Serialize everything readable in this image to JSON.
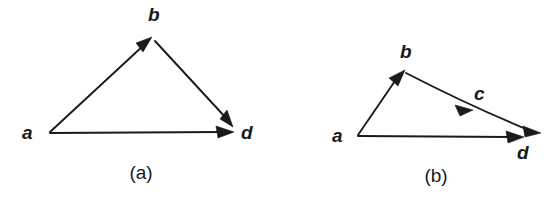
{
  "figure": {
    "background_color": "#ffffff",
    "ink_color": "#1a1a1a",
    "panels": [
      {
        "id": "panel-a",
        "caption": "(a)",
        "caption_x": 141,
        "caption_y": 179,
        "nodes": [
          {
            "id": "a",
            "label": "a",
            "label_x": 22,
            "label_y": 139,
            "point_x": 48,
            "point_y": 133
          },
          {
            "id": "b",
            "label": "b",
            "label_x": 148,
            "label_y": 21,
            "point_x": 152,
            "point_y": 37
          },
          {
            "id": "d",
            "label": "d",
            "label_x": 241,
            "label_y": 139,
            "point_x": 233,
            "point_y": 133
          }
        ],
        "edges": [
          {
            "id": "a-to-b",
            "from": "a",
            "to": "b",
            "label": "",
            "arrow": "end"
          },
          {
            "id": "b-to-d",
            "from": "b",
            "to": "d",
            "label": "",
            "arrow": "end"
          },
          {
            "id": "a-to-d",
            "from": "a",
            "to": "d",
            "label": "",
            "arrow": "end"
          }
        ]
      },
      {
        "id": "panel-b",
        "caption": "(b)",
        "caption_x": 436,
        "caption_y": 182,
        "nodes": [
          {
            "id": "a",
            "label": "a",
            "label_x": 332,
            "label_y": 142,
            "point_x": 357,
            "point_y": 136
          },
          {
            "id": "b",
            "label": "b",
            "label_x": 400,
            "label_y": 58,
            "point_x": 404,
            "point_y": 71
          },
          {
            "id": "d",
            "label": "d",
            "label_x": 517,
            "label_y": 159,
            "point_x": 540,
            "point_y": 134
          },
          {
            "id": "c",
            "label": "c",
            "label_x": 474,
            "label_y": 100,
            "point_x": 474,
            "point_y": 100
          }
        ],
        "edges": [
          {
            "id": "a-to-b",
            "from": "a",
            "to": "b",
            "label": "",
            "arrow": "end"
          },
          {
            "id": "b-to-d",
            "from": "b",
            "to": "d",
            "label": "c",
            "arrow": "mid-and-end"
          },
          {
            "id": "a-to-d",
            "from": "a",
            "to": "d",
            "label": "",
            "arrow": "end"
          }
        ]
      }
    ]
  }
}
